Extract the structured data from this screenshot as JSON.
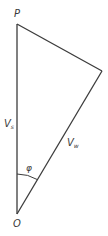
{
  "diagram": {
    "type": "vector-triangle",
    "colors": {
      "line": "#3c3c3c",
      "text": "#3a3a3a",
      "background": "#ffffff"
    },
    "vertices": {
      "P": {
        "label": "P",
        "x": 17,
        "y": 24
      },
      "R": {
        "x": 102,
        "y": 71
      },
      "O": {
        "label": "O",
        "x": 17,
        "y": 214
      }
    },
    "labels": {
      "top_vertex": "P",
      "bottom_vertex": "O",
      "vertical_side": {
        "main": "V",
        "sub": "s"
      },
      "diagonal_side": {
        "main": "V",
        "sub": "w"
      },
      "angle": "φ"
    }
  }
}
